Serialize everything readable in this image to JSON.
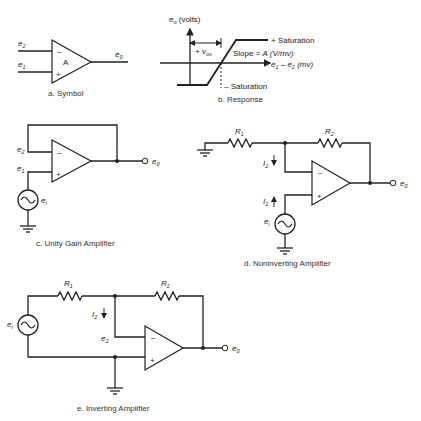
{
  "panels": {
    "symbol": {
      "caption": "a. Symbol",
      "gain_label": "A",
      "inv_input": "e",
      "inv_input_sub": "2",
      "noninv_input": "e",
      "noninv_input_sub": "1",
      "output": "e",
      "output_sub": "0",
      "minus": "–",
      "plus": "+"
    },
    "response": {
      "caption": "b. Response",
      "y_axis_label": "e",
      "y_axis_sub": "o",
      "y_axis_unit": " (volts)",
      "x_axis_label_a": "e",
      "x_axis_sub_a": "1",
      "x_axis_minus": " – e",
      "x_axis_sub_b": "2",
      "x_axis_unit": " (mv)",
      "pos_sat": "+ Saturation",
      "neg_sat": "– Saturation",
      "slope_text": "Slope = ",
      "slope_var": "A",
      "slope_unit": " (V/mv)",
      "offset_label": "+ v",
      "offset_sub": "os"
    },
    "unity": {
      "caption": "c. Unity Gain Amplifier",
      "e2": "e",
      "e2_sub": "2",
      "e1": "e",
      "e1_sub": "1",
      "ei": "e",
      "ei_sub": "i",
      "eo": "e",
      "eo_sub": "0",
      "minus": "–",
      "plus": "+"
    },
    "noninverting": {
      "caption": "d. Noninverting Amplifier",
      "r1": "R",
      "r1_sub": "1",
      "r2": "R",
      "r2_sub": "2",
      "i2": "I",
      "i2_sub": "2",
      "i1": "I",
      "i1_sub": "1",
      "ei": "e",
      "ei_sub": "i",
      "eo": "e",
      "eo_sub": "0",
      "minus": "–",
      "plus": "+"
    },
    "inverting": {
      "caption": "e. Inverting Amplifier",
      "r1": "R",
      "r1_sub": "1",
      "r2": "R",
      "r2_sub": "2",
      "i2": "I",
      "i2_sub": "2",
      "e2": "e",
      "e2_sub": "2",
      "ei": "e",
      "ei_sub": "i",
      "eo": "e",
      "eo_sub": "0",
      "minus": "–",
      "plus": "+"
    }
  }
}
